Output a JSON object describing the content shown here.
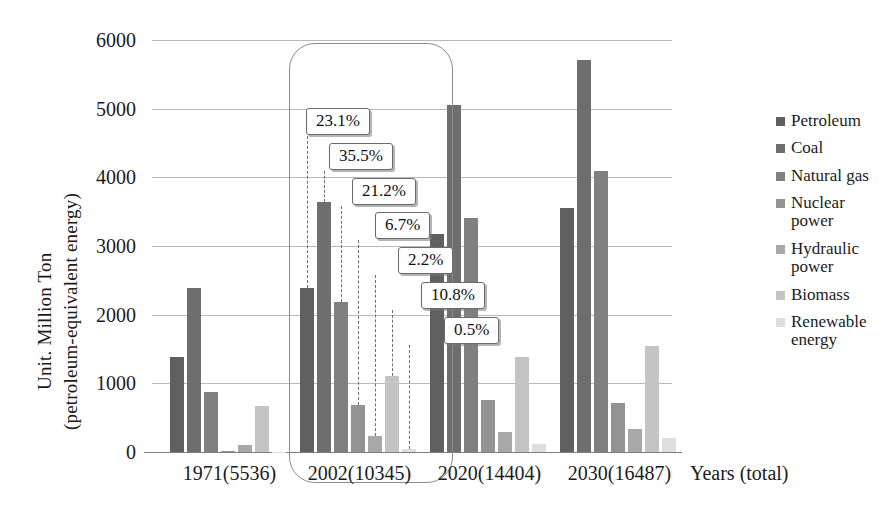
{
  "chart_data": {
    "type": "bar",
    "title": "",
    "xlabel": "Years (total)",
    "ylabel_line1": "Unit. Million Ton",
    "ylabel_line2": "(petroleum-equivalent energy)",
    "categories": [
      "1971(5536)",
      "2002(10345)",
      "2020(14404)",
      "2030(16487)"
    ],
    "ylim": [
      0,
      6000
    ],
    "yticks": [
      0,
      1000,
      2000,
      3000,
      4000,
      5000,
      6000
    ],
    "ytick_labels": [
      "0",
      "1000",
      "2000",
      "3000",
      "4000",
      "5000",
      "6000"
    ],
    "grid": true,
    "legend_position": "right",
    "series": [
      {
        "name": "Petroleum",
        "color": "#5f5f5f",
        "values": [
          1390,
          2390,
          3180,
          3560
        ]
      },
      {
        "name": "Coal",
        "color": "#6e6e6e",
        "values": [
          2390,
          3640,
          5050,
          5710
        ]
      },
      {
        "name": "Natural gas",
        "color": "#808080",
        "values": [
          880,
          2190,
          3410,
          4090
        ]
      },
      {
        "name": "Nuclear power",
        "color": "#939393",
        "values": [
          10,
          690,
          760,
          720
        ]
      },
      {
        "name": "Hydraulic power",
        "color": "#a8a8a8",
        "values": [
          100,
          230,
          290,
          330
        ]
      },
      {
        "name": "Biomass",
        "color": "#c4c4c4",
        "values": [
          670,
          1110,
          1390,
          1540
        ]
      },
      {
        "name": "Renewable energy",
        "color": "#dedede",
        "values": [
          0,
          50,
          120,
          210
        ]
      }
    ],
    "legend_entries": [
      {
        "label": "Petroleum",
        "color": "#5f5f5f"
      },
      {
        "label": "Coal",
        "color": "#6e6e6e"
      },
      {
        "label": "Natural gas",
        "color": "#808080"
      },
      {
        "label": "Nuclear\npower",
        "color": "#939393"
      },
      {
        "label": "Hydraulic\npower",
        "color": "#a8a8a8"
      },
      {
        "label": "Biomass",
        "color": "#c4c4c4"
      },
      {
        "label": "Renewable\nenergy",
        "color": "#dedede"
      }
    ],
    "annotations": {
      "highlighted_group": "2002(10345)",
      "share_callouts": [
        {
          "series": "Petroleum",
          "value": "23.1%"
        },
        {
          "series": "Coal",
          "value": "35.5%"
        },
        {
          "series": "Natural gas",
          "value": "21.2%"
        },
        {
          "series": "Nuclear power",
          "value": "6.7%"
        },
        {
          "series": "Hydraulic power",
          "value": "2.2%"
        },
        {
          "series": "Biomass",
          "value": "10.8%"
        },
        {
          "series": "Renewable energy",
          "value": "0.5%"
        }
      ]
    }
  }
}
